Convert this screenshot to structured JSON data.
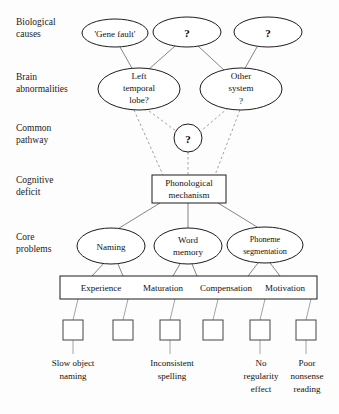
{
  "figure": {
    "background_color": "#fdfdfd",
    "line_color": "#666666",
    "shape_stroke": "#1c1c1c"
  },
  "row_labels": [
    {
      "id": "biological-causes",
      "line1": "Biological",
      "line2": "causes"
    },
    {
      "id": "brain-abnormalities",
      "line1": "Brain",
      "line2": "abnormalities"
    },
    {
      "id": "common-pathway",
      "line1": "Common",
      "line2": "pathway"
    },
    {
      "id": "cognitive-deficit",
      "line1": "Cognitive",
      "line2": "deficit"
    },
    {
      "id": "core-problems",
      "line1": "Core",
      "line2": "problems"
    }
  ],
  "biological_causes": [
    {
      "id": "gene-fault",
      "label": "'Gene fault'"
    },
    {
      "id": "bio-unknown-1",
      "label": "?"
    },
    {
      "id": "bio-unknown-2",
      "label": "?"
    }
  ],
  "brain_abnormalities": [
    {
      "id": "left-temporal-lobe",
      "line1": "Left",
      "line2": "temporal",
      "line3": "lobe?"
    },
    {
      "id": "other-system",
      "line1": "Other",
      "line2": "system",
      "line3": "?"
    }
  ],
  "common_pathway": {
    "id": "common-pathway-unknown",
    "label": "?"
  },
  "cognitive_deficit": {
    "id": "phonological-mechanism",
    "line1": "Phonological",
    "line2": "mechanism"
  },
  "core_problems": [
    {
      "id": "naming",
      "line1": "Naming",
      "line2": ""
    },
    {
      "id": "word-memory",
      "line1": "Word",
      "line2": "memory"
    },
    {
      "id": "phoneme-segmentation",
      "line1": "Phoneme",
      "line2": "segmentation"
    }
  ],
  "moderators": {
    "id": "moderator-band",
    "items": [
      "Experience",
      "Maturation",
      "Compensation",
      "Motivation"
    ]
  },
  "behavioural_outcomes": [
    {
      "id": "outcome-1",
      "line1": "Slow object",
      "line2": "naming",
      "line3": ""
    },
    {
      "id": "outcome-2",
      "line1": "",
      "line2": "",
      "line3": ""
    },
    {
      "id": "outcome-3",
      "line1": "Inconsistent",
      "line2": "spelling",
      "line3": ""
    },
    {
      "id": "outcome-4",
      "line1": "",
      "line2": "",
      "line3": ""
    },
    {
      "id": "outcome-5",
      "line1": "No",
      "line2": "regularity",
      "line3": "effect"
    },
    {
      "id": "outcome-6",
      "line1": "Poor",
      "line2": "nonsense",
      "line3": "reading"
    }
  ]
}
